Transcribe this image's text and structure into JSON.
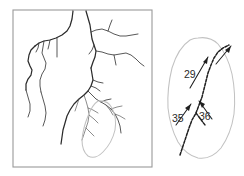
{
  "figure": {
    "type": "map-figure",
    "background_color": "#ffffff",
    "width": 244,
    "height": 176
  },
  "main_panel": {
    "name": "stream-network-map",
    "frame": {
      "x": 13,
      "y": 10,
      "width": 139,
      "height": 157
    },
    "frame_color": "#9a9a9a",
    "stream_color": "#3a3a3a",
    "highlight_color": "#c2c2c2",
    "streams": [
      "M 73,11 L 72,19 L 70,26 L 67,31 L 62,35 L 56,38 L 50,40 L 44,41 L 39,43 L 35,46",
      "M 35,46 L 31,50 L 29,55 L 28,61 L 30,66 L 32,70 L 31,75 L 28,79 L 26,84 L 26,90",
      "M 44,41 L 43,47 L 42,53 L 44,58 L 46,63 L 45,69 L 42,74 L 40,80 L 40,86 L 41,92",
      "M 39,43 L 38,48 L 36,52",
      "M 50,40 L 49,45 L 48,49",
      "M 57,38 L 57,44 L 57,51 L 57,57",
      "M 26,90 L 28,97 L 30,104 L 30,111 L 28,117",
      "M 41,92 L 43,99 L 45,106 L 46,113 L 45,120 L 43,126",
      "M 86,11 L 88,18 L 90,25 L 91,32 L 92,39 L 94,45 L 96,51 L 95,57 L 93,62 L 91,68",
      "M 91,32 L 96,30 L 102,29 L 108,31 L 114,34 L 120,36 L 126,36 L 132,35 L 138,34",
      "M 108,31 L 110,25 L 112,20",
      "M 94,45 L 92,50 L 89,54",
      "M 96,51 L 102,52 L 108,54 L 114,55 L 120,54 L 126,53 L 131,55 L 136,59 L 140,63 L 144,66",
      "M 114,55 L 115,60 L 116,65",
      "M 91,68 L 92,74 L 93,80 L 91,86 L 88,91 L 84,95 L 79,99 L 74,104 L 70,110 L 67,116 L 65,123 L 63,130 L 62,137 L 61,144",
      "M 93,80 L 98,82 L 103,83",
      "M 91,86 L 96,88 L 100,91",
      "M 88,91 L 92,95 L 96,99 L 101,102 L 106,105 L 111,109 L 115,114 L 118,120 L 120,126 L 121,133",
      "M 101,102 L 106,100 L 111,99",
      "M 106,105 L 110,110 L 113,115",
      "M 111,109 L 117,107 L 122,106",
      "M 115,114 L 120,116 L 125,119",
      "M 84,95 L 86,101 L 88,108 L 89,115 L 88,122 L 86,128 L 84,134 L 82,140",
      "M 88,108 L 93,110 L 98,113",
      "M 89,115 L 94,119 L 98,123",
      "M 86,128 L 90,132 L 94,136",
      "M 79,99 L 77,105 L 75,111"
    ],
    "highlight_basin_path": "M 98,101 Q 108,100 112,108 Q 117,118 115,130 Q 112,143 103,152 Q 95,160 88,156 Q 82,151 82,140 Q 83,128 88,116 Q 92,105 98,101"
  },
  "inset_panel": {
    "name": "sub-basin-detail",
    "outline_color": "#c2c2c2",
    "outline_path": "M 198,38 Q 210,36 218,44 Q 228,56 232,74 Q 236,94 234,114 Q 231,134 221,148 Q 211,160 198,158 Q 186,155 178,142 Q 170,127 168,108 Q 167,88 172,68 Q 178,48 190,40 Q 194,38 198,38",
    "stream_paths": [
      "M 180,155 L 183,146 L 186,137 L 189,128 L 192,120 L 196,113",
      "M 196,113 L 199,105 L 202,97 L 204,89 L 206,81 L 208,73 L 211,65 L 214,58 L 218,52 L 223,48 L 229,45",
      "M 196,113 L 199,117 L 202,121 L 205,125"
    ],
    "arrows": [
      {
        "name": "arrow-29",
        "label": "29",
        "line": {
          "x1": 190,
          "y1": 88,
          "x2": 208,
          "y2": 57
        },
        "head": "M 208,57 L 203,62 L 207,64 Z",
        "label_pos": {
          "x": 184,
          "y": 75
        }
      },
      {
        "name": "arrow-upper-right",
        "label": "",
        "line": {
          "x1": 216,
          "y1": 64,
          "x2": 231,
          "y2": 46
        },
        "head": "M 231,46 L 225,50 L 229,53 Z",
        "label_pos": null
      },
      {
        "name": "arrow-35",
        "label": "35",
        "line": {
          "x1": 176,
          "y1": 125,
          "x2": 191,
          "y2": 104
        },
        "head": "M 191,104 L 185,108 L 189,111 Z",
        "label_pos": {
          "x": 172,
          "y": 119
        }
      },
      {
        "name": "arrow-36",
        "label": "36",
        "line": {
          "x1": 212,
          "y1": 119,
          "x2": 199,
          "y2": 101
        },
        "head": "M 199,101 L 202,108 L 205,104 Z",
        "label_pos": {
          "x": 199,
          "y": 117
        }
      }
    ],
    "labels": [
      {
        "id": "label-29",
        "text": "29",
        "x": 184,
        "y": 75
      },
      {
        "id": "label-35",
        "text": "35",
        "x": 172,
        "y": 119
      },
      {
        "id": "label-36",
        "text": "36",
        "x": 199,
        "y": 117
      }
    ]
  }
}
